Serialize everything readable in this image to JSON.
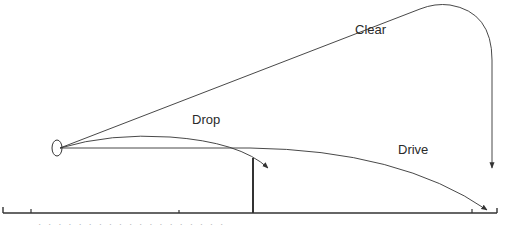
{
  "diagram": {
    "colors": {
      "line": "#333333",
      "text": "#2a2a2a",
      "background": "#ffffff"
    },
    "labels": {
      "clear": "Clear",
      "drop": "Drop",
      "drive": "Drive"
    },
    "elements": {
      "origin": "shuttle-origin",
      "net": "net-post",
      "floor": "court-floor"
    },
    "footer_text": "· · · · · · · · · · · · · · · · · · ·"
  }
}
